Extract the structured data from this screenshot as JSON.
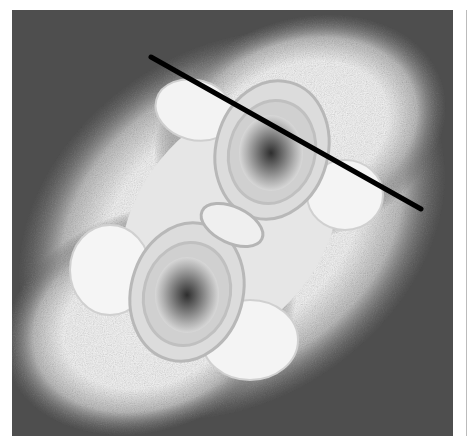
{
  "figure": {
    "colors": {
      "background_dark": "#4a4a4a",
      "bright_region": "#f4f4f4",
      "contour": "#b8b8b8",
      "core_dark": "#303030",
      "line": "#000000"
    },
    "line_segment": {
      "x1": 151,
      "y1": 57,
      "x2": 421,
      "y2": 209,
      "width": 5
    },
    "lobes": [
      {
        "cx": 271,
        "cy": 153
      },
      {
        "cx": 187,
        "cy": 295
      }
    ],
    "central_oval": {
      "cx": 232,
      "cy": 225
    }
  }
}
